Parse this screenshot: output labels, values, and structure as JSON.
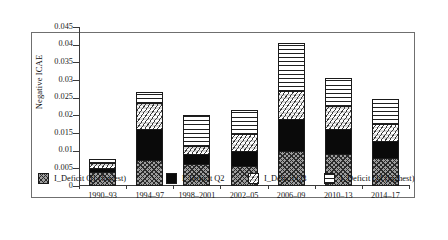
{
  "chart_data": {
    "type": "bar",
    "subtype": "stacked",
    "title": "",
    "xlabel": "",
    "ylabel": "Negative ICAE",
    "ylim": [
      0,
      0.045
    ],
    "yticks": [
      "0",
      "0.005",
      "0.01",
      "0.015",
      "0.02",
      "0.025",
      "0.03",
      "0.035",
      "0.04",
      "0.045"
    ],
    "ytick_values": [
      0,
      0.005,
      0.01,
      0.015,
      0.02,
      0.025,
      0.03,
      0.035,
      0.04,
      0.045
    ],
    "grid": false,
    "legend_position": "bottom",
    "categories": [
      "1990–93",
      "1994–97",
      "1998–2001",
      "2002–05",
      "2006–09",
      "2010–13",
      "2014–17"
    ],
    "series": [
      {
        "name": "I_Deficit Q1 (lowest)",
        "pattern": "cross-hatch",
        "values": [
          0.004,
          0.0075,
          0.0062,
          0.0057,
          0.01,
          0.009,
          0.0078
        ]
      },
      {
        "name": "I_Deficit Q2",
        "pattern": "solid-black",
        "values": [
          0.0012,
          0.0085,
          0.003,
          0.0042,
          0.009,
          0.0072,
          0.005
        ]
      },
      {
        "name": "I_Deficit Q3",
        "pattern": "wavy-speckle",
        "values": [
          0.0012,
          0.0075,
          0.0022,
          0.0048,
          0.008,
          0.0065,
          0.0048
        ]
      },
      {
        "name": "I_Deficit Q4 (highest)",
        "pattern": "horizontal-lines",
        "values": [
          0.0012,
          0.003,
          0.0086,
          0.0068,
          0.0135,
          0.0078,
          0.0069
        ]
      }
    ],
    "totals": [
      0.0076,
      0.0265,
      0.02,
      0.0215,
      0.0405,
      0.0305,
      0.0245
    ]
  }
}
